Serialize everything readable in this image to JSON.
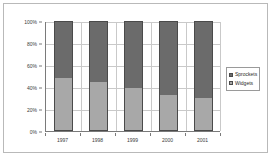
{
  "chart_data": {
    "type": "bar",
    "subtype": "100-percent-stacked-column",
    "title": "",
    "xlabel": "",
    "ylabel": "",
    "categories": [
      "1997",
      "1998",
      "1999",
      "2000",
      "2001"
    ],
    "series": [
      {
        "name": "Widgets",
        "values": [
          48,
          45,
          39,
          33,
          30
        ],
        "color": "#a8a8a8",
        "stack_position": "bottom"
      },
      {
        "name": "Sprockets",
        "values": [
          52,
          55,
          61,
          67,
          70
        ],
        "color": "#6b6b6b",
        "stack_position": "top"
      }
    ],
    "ylim": [
      0,
      100
    ],
    "y_ticks": [
      0,
      20,
      40,
      60,
      80,
      100
    ],
    "y_tick_labels": [
      "0%",
      "20%",
      "40%",
      "60%",
      "80%",
      "100%"
    ],
    "grid": true,
    "grid_axis": "both",
    "legend_position": "right",
    "legend_entries": [
      "Sprockets",
      "Widgets"
    ],
    "units": "percent"
  },
  "colors": {
    "sprockets": "#6b6b6b",
    "widgets": "#a8a8a8",
    "gridline": "#c9c9c9",
    "axis": "#7a7a7a",
    "frame": "#b9b9b9",
    "bar_outline": "#4a4a4a",
    "background": "#ffffff",
    "text": "#3a3a3a"
  }
}
